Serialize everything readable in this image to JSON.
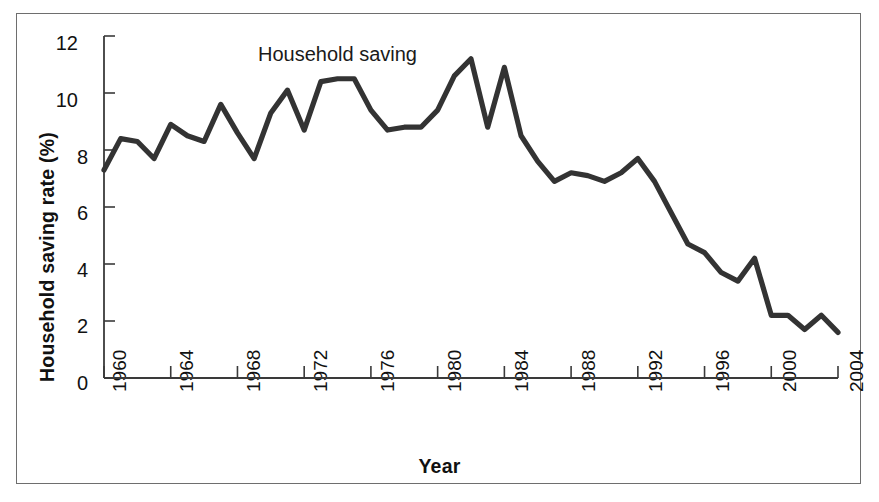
{
  "figure": {
    "frame_color": "#6e6e6e",
    "background": "#ffffff"
  },
  "chart_data": {
    "type": "line",
    "title": "",
    "subtitle": "",
    "xlabel": "Year",
    "ylabel": "Household saving rate (%)",
    "series_label": "Household saving",
    "line_color": "#333333",
    "grid": false,
    "legend_position": "inline-annotation",
    "xlim": [
      1960,
      2004
    ],
    "ylim": [
      0,
      12
    ],
    "xticks": [
      1960,
      1964,
      1968,
      1972,
      1976,
      1980,
      1984,
      1988,
      1992,
      1996,
      2000,
      2004
    ],
    "xtick_labels": [
      "1960",
      "1964",
      "1968",
      "1972",
      "1976",
      "1980",
      "1984",
      "1988",
      "1992",
      "1996",
      "2000",
      "2004"
    ],
    "yticks": [
      0,
      2,
      4,
      6,
      8,
      10,
      12
    ],
    "ytick_labels": [
      "0",
      "2",
      "4",
      "6",
      "8",
      "10",
      "12"
    ],
    "series": [
      {
        "name": "Household saving",
        "x": [
          1960,
          1961,
          1962,
          1963,
          1964,
          1965,
          1966,
          1967,
          1968,
          1969,
          1970,
          1971,
          1972,
          1973,
          1974,
          1975,
          1976,
          1977,
          1978,
          1979,
          1980,
          1981,
          1982,
          1983,
          1984,
          1985,
          1986,
          1987,
          1988,
          1989,
          1990,
          1991,
          1992,
          1993,
          1994,
          1995,
          1996,
          1997,
          1998,
          1999,
          2000,
          2001,
          2002,
          2003,
          2004
        ],
        "values": [
          7.3,
          8.4,
          8.3,
          7.7,
          8.9,
          8.5,
          8.3,
          9.6,
          8.6,
          7.7,
          9.3,
          10.1,
          8.7,
          10.4,
          10.5,
          10.5,
          9.4,
          8.7,
          8.8,
          8.8,
          9.4,
          10.6,
          11.2,
          8.8,
          10.9,
          8.5,
          7.6,
          6.9,
          7.2,
          7.1,
          6.9,
          7.2,
          7.7,
          6.9,
          5.8,
          4.7,
          4.4,
          3.7,
          3.4,
          4.2,
          2.2,
          2.2,
          1.7,
          2.2,
          1.6
        ]
      }
    ]
  }
}
